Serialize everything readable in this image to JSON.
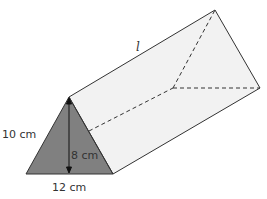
{
  "figure": {
    "type": "triangular-prism",
    "labels": {
      "slant_side": "10 cm",
      "height": "8 cm",
      "base": "12 cm",
      "length": "l"
    },
    "colors": {
      "front_face": "#808080",
      "side_faces": "#f2f2f2",
      "edges": "#333333"
    }
  }
}
